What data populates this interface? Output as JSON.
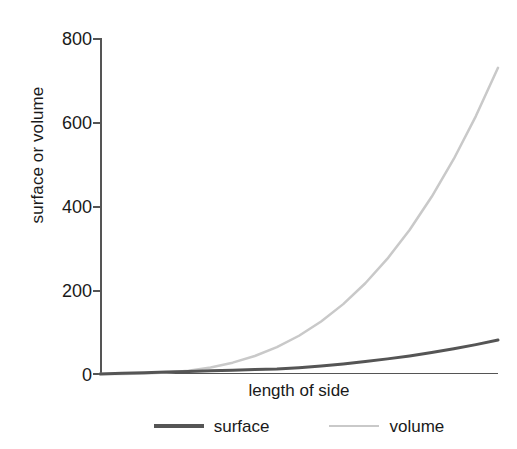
{
  "chart_data": {
    "type": "line",
    "title": "",
    "subtitle": "",
    "xlabel": "length of side",
    "ylabel": "surface or volume",
    "grid": false,
    "legend_position": "bottom-center",
    "xlim": [
      0,
      9
    ],
    "ylim": [
      0,
      800
    ],
    "yticks": [
      0,
      200,
      400,
      600,
      800
    ],
    "ytick_labels": [
      "0",
      "200",
      "400",
      "600",
      "800"
    ],
    "xticks": [],
    "xtick_labels": [],
    "x": [
      0,
      0.5,
      1,
      1.5,
      2,
      2.5,
      3,
      3.5,
      4,
      4.5,
      5,
      5.5,
      6,
      6.5,
      7,
      7.5,
      8,
      8.5,
      9
    ],
    "series": [
      {
        "name": "surface",
        "color": "#555555",
        "width": 3,
        "values": [
          0,
          1.5,
          3,
          4.5,
          6,
          7.5,
          9,
          10.5,
          12,
          15,
          19,
          24,
          30,
          36,
          43,
          51,
          60,
          70,
          81
        ]
      },
      {
        "name": "volume",
        "color": "#c9c9c9",
        "width": 2.5,
        "values": [
          0,
          0.1,
          1,
          3.4,
          8,
          15.6,
          27,
          42.9,
          64,
          91.1,
          125,
          166.4,
          216,
          274.6,
          343,
          421.9,
          512,
          614.1,
          729
        ]
      }
    ],
    "annotations": []
  },
  "legend": {
    "entries": [
      {
        "label": "surface",
        "color": "#555555"
      },
      {
        "label": "volume",
        "color": "#c9c9c9"
      }
    ]
  },
  "axes": {
    "y_title": "surface or volume",
    "x_title": "length of side",
    "y_tick_0": "0",
    "y_tick_1": "200",
    "y_tick_2": "400",
    "y_tick_3": "600",
    "y_tick_4": "800"
  },
  "colors": {
    "surface_line": "#555555",
    "volume_line": "#c9c9c9",
    "axis": "#555555",
    "text": "#1a1a1a",
    "background": "#ffffff"
  }
}
